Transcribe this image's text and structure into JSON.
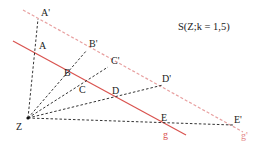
{
  "title": "S(Z;k = 1,5)",
  "colors": {
    "line_g": "#d9534f",
    "line_g_prime": "#e8a0a0",
    "rays": "#333333",
    "text": "#222222"
  },
  "center": {
    "label": "Z",
    "x": 28,
    "y": 118
  },
  "line_g": {
    "label": "g",
    "x1": 13,
    "y1": 41,
    "x2": 186,
    "y2": 135
  },
  "line_g_prime": {
    "label": "g'",
    "x1": 23,
    "y1": 10,
    "x2": 243,
    "y2": 132
  },
  "points": [
    {
      "label": "A",
      "x": 36,
      "y": 52
    },
    {
      "label": "B",
      "x": 69,
      "y": 80
    },
    {
      "label": "C",
      "x": 82,
      "y": 82
    },
    {
      "label": "D",
      "x": 115,
      "y": 96
    },
    {
      "label": "E",
      "x": 165,
      "y": 124
    }
  ],
  "image_points": [
    {
      "label": "A'",
      "x": 38,
      "y": 19
    },
    {
      "label": "B'",
      "x": 87,
      "y": 50
    },
    {
      "label": "C'",
      "x": 108,
      "y": 67
    },
    {
      "label": "D'",
      "x": 163,
      "y": 85
    },
    {
      "label": "E'",
      "x": 233,
      "y": 125
    }
  ],
  "labels": {
    "A": "A",
    "B": "B",
    "C": "C",
    "D": "D",
    "E": "E",
    "A_prime": "A'",
    "B_prime": "B'",
    "C_prime": "C'",
    "D_prime": "D'",
    "E_prime": "E'",
    "Z": "Z",
    "g": "g",
    "g_prime": "g'"
  }
}
